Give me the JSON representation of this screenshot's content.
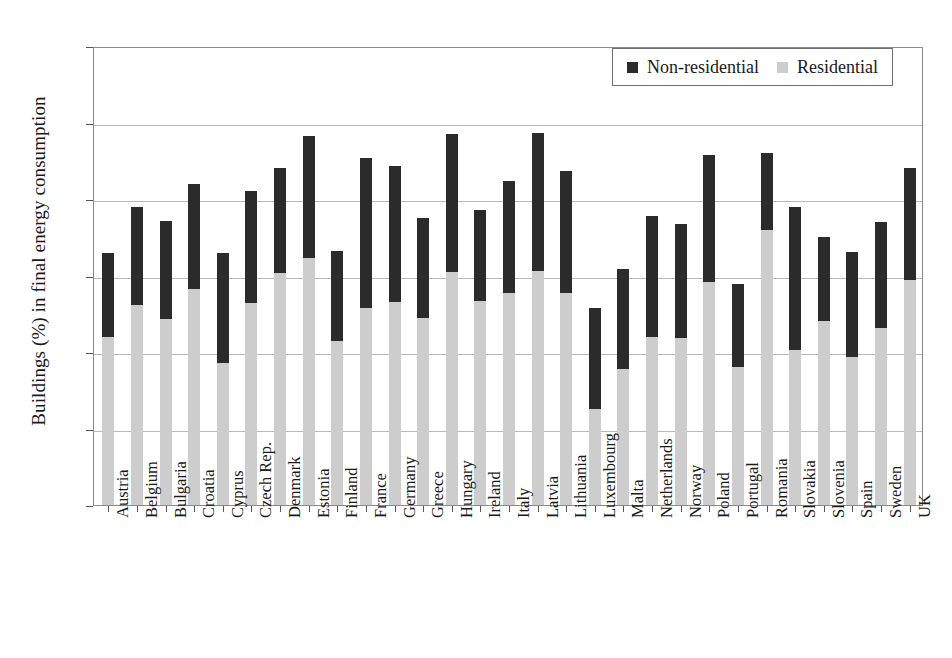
{
  "chart_data": {
    "type": "bar",
    "stacked": true,
    "title": "",
    "xlabel": "",
    "ylabel": "Buildings (%) in final energy consumption",
    "ylim": [
      0,
      60
    ],
    "yticks": [
      0,
      10,
      20,
      30,
      40,
      50,
      60
    ],
    "grid": "horizontal",
    "legend_position": "top-right",
    "categories": [
      "Austria",
      "Belgium",
      "Bulgaria",
      "Croatia",
      "Cyprus",
      "Czech Rep.",
      "Denmark",
      "Estonia",
      "Finland",
      "France",
      "Germany",
      "Greece",
      "Hungary",
      "Ireland",
      "Italy",
      "Latvia",
      "Lithuania",
      "Luxembourg",
      "Malta",
      "Netherlands",
      "Norway",
      "Poland",
      "Portugal",
      "Romania",
      "Slovakia",
      "Slovenia",
      "Spain",
      "Sweden",
      "UK"
    ],
    "series": [
      {
        "name": "Residential",
        "color": "#cdcdcd",
        "values": [
          22.0,
          26.2,
          24.3,
          28.2,
          18.6,
          26.4,
          30.3,
          32.3,
          21.4,
          25.7,
          26.6,
          24.4,
          30.5,
          26.7,
          27.7,
          30.6,
          27.7,
          12.6,
          17.8,
          22.0,
          21.8,
          29.2,
          18.1,
          36.0,
          20.2,
          24.1,
          19.3,
          23.1,
          29.4
        ]
      },
      {
        "name": "Non-residential",
        "color": "#2b2b2b",
        "values": [
          11.0,
          12.8,
          12.8,
          13.8,
          14.4,
          14.7,
          13.8,
          15.9,
          11.8,
          19.7,
          17.7,
          13.1,
          18.0,
          11.8,
          14.7,
          18.0,
          16.0,
          13.2,
          13.0,
          15.8,
          14.9,
          16.6,
          10.8,
          10.0,
          18.8,
          10.9,
          13.8,
          13.9,
          14.7
        ]
      }
    ],
    "totals": [
      33.0,
      39.0,
      37.1,
      42.0,
      33.0,
      41.1,
      44.1,
      48.2,
      33.2,
      45.4,
      44.3,
      37.5,
      48.5,
      38.5,
      42.4,
      48.6,
      43.7,
      25.8,
      30.8,
      37.8,
      36.7,
      45.8,
      28.9,
      46.0,
      39.0,
      35.0,
      33.1,
      37.0,
      44.1
    ]
  }
}
